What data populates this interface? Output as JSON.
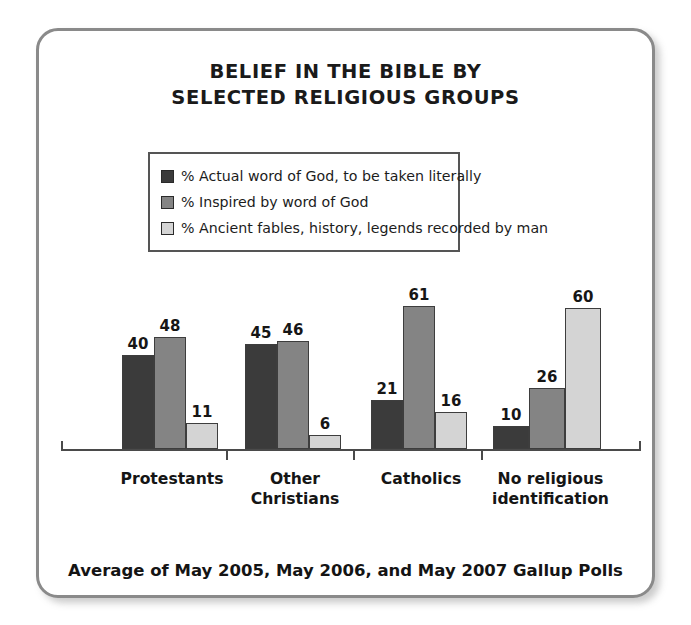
{
  "chart_data": {
    "type": "bar",
    "title": "BELIEF IN THE BIBLE BY SELECTED RELIGIOUS GROUPS",
    "title_lines": [
      "BELIEF IN THE BIBLE BY",
      "SELECTED RELIGIOUS GROUPS"
    ],
    "categories": [
      "Protestants",
      "Other Christians",
      "Catholics",
      "No religious identification"
    ],
    "category_lines": [
      [
        "Protestants"
      ],
      [
        "Other",
        "Christians"
      ],
      [
        "Catholics"
      ],
      [
        "No religious",
        "identification"
      ]
    ],
    "series": [
      {
        "name": "% Actual word of God, to be taken literally",
        "color": "#3b3b3b",
        "values": [
          40,
          45,
          21,
          10
        ]
      },
      {
        "name": "% Inspired by word of God",
        "color": "#848484",
        "values": [
          48,
          46,
          61,
          26
        ]
      },
      {
        "name": "% Ancient fables, history, legends recorded by man",
        "color": "#d4d4d4",
        "values": [
          11,
          6,
          16,
          60
        ]
      }
    ],
    "xlabel": "",
    "ylabel": "",
    "ylim": [
      0,
      70
    ],
    "grid": false,
    "legend_position": "top",
    "axis_visible": true,
    "value_labels_shown": true,
    "footnote": "Average of May 2005, May 2006, and May 2007 Gallup Polls"
  },
  "frame": {
    "border_color": "#8a8a8a",
    "background": "#ffffff"
  }
}
